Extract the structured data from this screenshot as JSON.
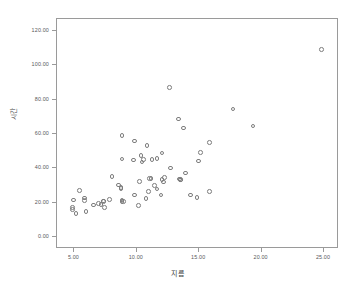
{
  "chart_data": {
    "type": "scatter",
    "title": "",
    "xlabel": "지름",
    "ylabel": "시간",
    "xlim": [
      3.6,
      26.2
    ],
    "ylim": [
      -7,
      127
    ],
    "grid": false,
    "legend": null,
    "xticks": [
      "5.00",
      "10.00",
      "15.00",
      "20.00",
      "25.00"
    ],
    "xtick_values": [
      5,
      10,
      15,
      20,
      25
    ],
    "yticks": [
      "0.00",
      "20.00",
      "40.00",
      "60.00",
      "80.00",
      "100.00",
      "120.00"
    ],
    "ytick_values": [
      0,
      20,
      40,
      60,
      80,
      100,
      120
    ],
    "marker": "open-circle",
    "marker_color": "#7d7d7d",
    "points": [
      [
        4.9,
        16.5
      ],
      [
        4.9,
        15.3
      ],
      [
        5.0,
        21.0
      ],
      [
        5.2,
        13.1
      ],
      [
        5.5,
        26.6
      ],
      [
        5.9,
        22.2
      ],
      [
        5.9,
        20.8
      ],
      [
        6.0,
        14.2
      ],
      [
        6.6,
        18.1
      ],
      [
        7.0,
        18.9
      ],
      [
        7.2,
        18.5
      ],
      [
        7.4,
        20.5
      ],
      [
        7.4,
        20.0
      ],
      [
        7.5,
        16.6
      ],
      [
        7.9,
        21.4
      ],
      [
        8.1,
        34.8
      ],
      [
        8.6,
        29.6
      ],
      [
        8.8,
        28.2
      ],
      [
        8.8,
        27.7
      ],
      [
        8.9,
        58.7
      ],
      [
        8.9,
        44.8
      ],
      [
        8.9,
        21.0
      ],
      [
        8.9,
        20.2
      ],
      [
        9.0,
        20.2
      ],
      [
        9.8,
        44.2
      ],
      [
        9.9,
        55.4
      ],
      [
        9.9,
        23.9
      ],
      [
        10.2,
        17.6
      ],
      [
        10.3,
        31.9
      ],
      [
        10.4,
        46.9
      ],
      [
        10.5,
        43.2
      ],
      [
        10.6,
        44.6
      ],
      [
        10.8,
        22.0
      ],
      [
        10.9,
        52.8
      ],
      [
        11.0,
        25.9
      ],
      [
        11.1,
        33.6
      ],
      [
        11.2,
        33.5
      ],
      [
        11.3,
        44.4
      ],
      [
        11.5,
        29.4
      ],
      [
        11.7,
        45.3
      ],
      [
        11.7,
        27.4
      ],
      [
        12.0,
        23.8
      ],
      [
        12.1,
        48.4
      ],
      [
        12.1,
        33.0
      ],
      [
        12.2,
        31.4
      ],
      [
        12.3,
        34.0
      ],
      [
        12.7,
        86.4
      ],
      [
        12.8,
        39.6
      ],
      [
        13.4,
        68.2
      ],
      [
        13.5,
        33.2
      ],
      [
        13.6,
        33.0
      ],
      [
        13.6,
        32.6
      ],
      [
        13.8,
        62.8
      ],
      [
        14.0,
        36.8
      ],
      [
        14.4,
        23.8
      ],
      [
        14.9,
        22.5
      ],
      [
        15.0,
        43.6
      ],
      [
        15.2,
        48.8
      ],
      [
        15.9,
        54.6
      ],
      [
        15.9,
        25.8
      ],
      [
        17.8,
        73.9
      ],
      [
        19.4,
        64.1
      ],
      [
        24.9,
        108.8
      ]
    ]
  }
}
